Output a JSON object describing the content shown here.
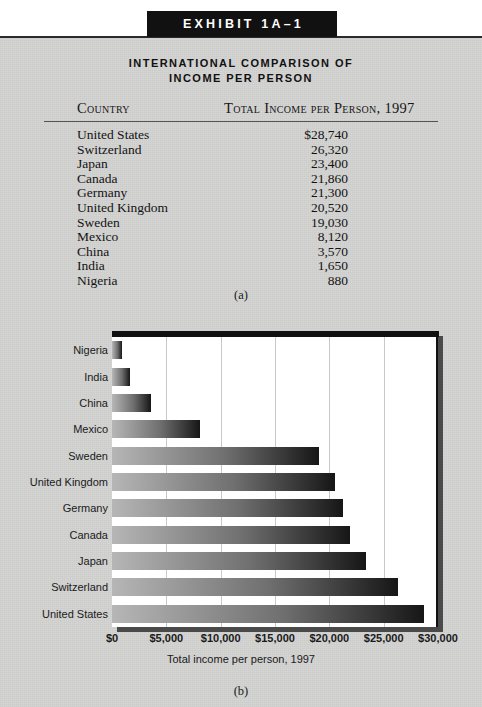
{
  "exhibit": {
    "banner_label": "EXHIBIT 1A–1",
    "title_line1": "INTERNATIONAL COMPARISON OF",
    "title_line2": "INCOME PER PERSON",
    "caption_a": "(a)",
    "caption_b": "(b)"
  },
  "table": {
    "col_country": "Country",
    "col_income": "Total Income per Person, 1997",
    "rows": [
      {
        "country": "United States",
        "income": "$28,740"
      },
      {
        "country": "Switzerland",
        "income": "26,320"
      },
      {
        "country": "Japan",
        "income": "23,400"
      },
      {
        "country": "Canada",
        "income": "21,860"
      },
      {
        "country": "Germany",
        "income": "21,300"
      },
      {
        "country": "United Kingdom",
        "income": "20,520"
      },
      {
        "country": "Sweden",
        "income": "19,030"
      },
      {
        "country": "Mexico",
        "income": "8,120"
      },
      {
        "country": "China",
        "income": "3,570"
      },
      {
        "country": "India",
        "income": "1,650"
      },
      {
        "country": "Nigeria",
        "income": "880"
      }
    ]
  },
  "chart_data": {
    "type": "bar",
    "orientation": "horizontal",
    "title": "",
    "xlabel": "Total income per person, 1997",
    "ylabel": "",
    "categories": [
      "Nigeria",
      "India",
      "China",
      "Mexico",
      "Sweden",
      "United Kingdom",
      "Germany",
      "Canada",
      "Japan",
      "Switzerland",
      "United States"
    ],
    "values": [
      880,
      1650,
      3570,
      8120,
      19030,
      20520,
      21300,
      21860,
      23400,
      26320,
      28740
    ],
    "xlim": [
      0,
      30000
    ],
    "xticks": [
      0,
      5000,
      10000,
      15000,
      20000,
      25000,
      30000
    ],
    "xtick_labels": [
      "$0",
      "$5,000",
      "$10,000",
      "$15,000",
      "$20,000",
      "$25,000",
      "$30,000"
    ],
    "grid": true,
    "legend": "none",
    "bar_gradient_from": "#b6b6b6",
    "bar_gradient_to": "#161616"
  },
  "colors": {
    "paper": "#d3d3d2",
    "banner": "#111111",
    "plot_background": "#ffffff",
    "gridline": "#c9c9c9",
    "text": "#131313"
  }
}
